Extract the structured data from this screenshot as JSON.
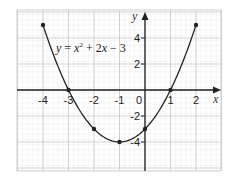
{
  "chart_data": {
    "type": "line",
    "title": "",
    "annotation": "y = x² + 2x − 3",
    "equation_parts": {
      "lhs": "y",
      "eq": " = ",
      "x1": "x",
      "sup": "2",
      "plus": " + 2",
      "x2": "x",
      "tail": " − 3"
    },
    "xlabel": "x",
    "ylabel": "y",
    "xlim": [
      -5,
      2.9
    ],
    "ylim": [
      -6.2,
      6.2
    ],
    "x_ticks": [
      -4,
      -3,
      -2,
      -1,
      0,
      1,
      2
    ],
    "x_tick_labels": [
      "-4",
      "-3",
      "-2",
      "-1",
      "0",
      "1",
      "2"
    ],
    "y_ticks": [
      4,
      2,
      -2,
      -4
    ],
    "y_tick_labels": [
      "4",
      "2",
      "-2",
      "-4"
    ],
    "grid": true,
    "legend": "none",
    "series": [
      {
        "name": "y = x^2 + 2x - 3",
        "x": [
          -4,
          -3,
          -2,
          -1,
          0,
          1,
          2
        ],
        "y": [
          5,
          0,
          -3,
          -4,
          -3,
          0,
          5
        ],
        "marker": "dot",
        "smooth": true
      }
    ],
    "colors": {
      "curve": "#222222",
      "axis": "#222222",
      "grid_major": "#c8c8c8",
      "grid_minor": "#ececec"
    }
  }
}
